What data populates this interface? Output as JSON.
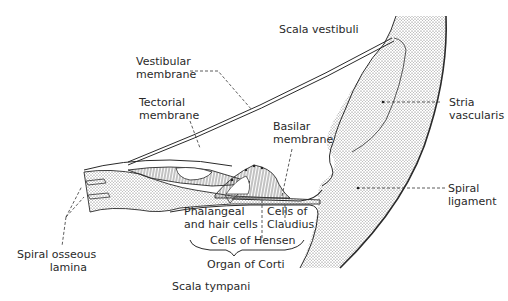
{
  "diagram": {
    "colors": {
      "ink": "#2a2a2a",
      "stipple": "#555555",
      "background": "#ffffff"
    },
    "regions": {
      "scala_vestibuli": "Scala vestibuli",
      "scala_tympani": "Scala tympani"
    },
    "labels": {
      "vestibular_membrane": [
        "Vestibular",
        "membrane"
      ],
      "tectorial_membrane": [
        "Tectorial",
        "membrane"
      ],
      "basilar_membrane": [
        "Basilar",
        "membrane"
      ],
      "stria_vascularis": [
        "Stria",
        "vascularis"
      ],
      "spiral_ligament": [
        "Spiral",
        "ligament"
      ],
      "phalangeal_hair_cells": [
        "Phalangeal",
        "and hair cells"
      ],
      "cells_of_claudius": [
        "Cells of",
        "Claudius"
      ],
      "cells_of_hensen": "Cells of Hensen",
      "organ_of_corti": "Organ of Corti",
      "spiral_osseous_lamina": [
        "Spiral osseous",
        "lamina"
      ]
    }
  }
}
